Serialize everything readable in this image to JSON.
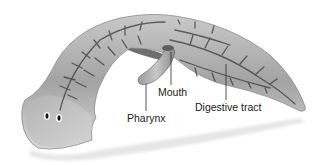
{
  "diagram": {
    "labels": {
      "mouth": "Mouth",
      "pharynx": "Pharynx",
      "digestive_tract": "Digestive tract"
    },
    "colors": {
      "body_light": "#d9d9d9",
      "body_mid": "#a6a6a6",
      "body_dark": "#5a5a5a",
      "gut": "#3a3a3a",
      "leader_line": "#2a2a2a",
      "text": "#1c1c1c",
      "background": "#ffffff"
    }
  }
}
